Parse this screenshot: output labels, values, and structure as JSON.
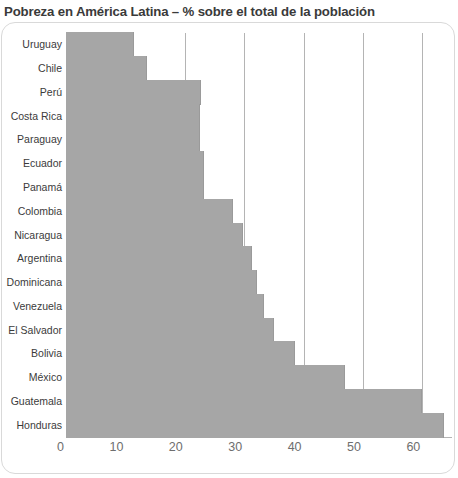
{
  "chart_data": {
    "type": "bar",
    "orientation": "horizontal",
    "title": "Pobreza en América Latina – % sobre el total de la población",
    "xlabel": "",
    "ylabel": "",
    "xlim": [
      0,
      65
    ],
    "grid": true,
    "legend": false,
    "xticks": [
      0,
      10,
      20,
      30,
      40,
      50,
      60
    ],
    "xtick_labels": [
      "0",
      "10",
      "20",
      "30",
      "40",
      "50",
      "60"
    ],
    "categories": [
      "Uruguay",
      "Chile",
      "Perú",
      "Costa Rica",
      "Paraguay",
      "Ecuador",
      "Panamá",
      "Colombia",
      "Nicaragua",
      "Argentina",
      "Dominicana",
      "Venezuela",
      "El Salvador",
      "Bolivia",
      "México",
      "Guatemala",
      "Honduras"
    ],
    "values": [
      11.5,
      13.7,
      22.7,
      22.5,
      22.5,
      23.3,
      23.3,
      28.2,
      29.8,
      31.4,
      32.2,
      33.4,
      35.1,
      38.6,
      47.0,
      60.0,
      63.6
    ],
    "series": [
      {
        "name": "Pobreza",
        "values": [
          11.5,
          13.7,
          22.7,
          22.5,
          22.5,
          23.3,
          23.3,
          28.2,
          29.8,
          31.4,
          32.2,
          33.4,
          35.1,
          38.6,
          47.0,
          60.0,
          63.6
        ]
      }
    ],
    "colors": {
      "bar": "#a6a6a6",
      "gridline": "#b4b4b4",
      "axis": "#4a4a4a",
      "title_text": "#3a3a3a",
      "label_text": "#3b3b3b",
      "tick_text": "#6e6e6e",
      "background": "#ffffff",
      "frame": "#d9d9d9"
    }
  }
}
